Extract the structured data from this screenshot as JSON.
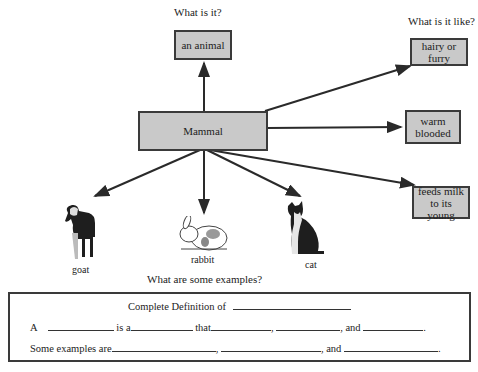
{
  "questions": {
    "what_is_it": "What is it?",
    "what_is_it_like": "What is it like?",
    "examples": "What are some examples?"
  },
  "center": {
    "label": "Mammal"
  },
  "category": {
    "label": "an animal"
  },
  "properties": [
    {
      "label": "hairy or furry"
    },
    {
      "label": "warm blooded"
    },
    {
      "label": "feeds milk to its young"
    }
  ],
  "examples": [
    {
      "label": "goat",
      "icon": "goat-icon"
    },
    {
      "label": "rabbit",
      "icon": "rabbit-icon"
    },
    {
      "label": "cat",
      "icon": "cat-icon"
    }
  ],
  "definition": {
    "title": "Complete Definition of",
    "line1": {
      "a": "A",
      "is_a": "is a",
      "that": "that",
      "comma": ",",
      "and": ", and",
      "period": "."
    },
    "line2": {
      "lead": "Some examples are",
      "comma": ",",
      "and": ", and",
      "period": "."
    }
  },
  "colors": {
    "box_fill": "#c9c9c9",
    "box_border": "#3a3a3a",
    "arrow": "#2a2a2a"
  }
}
